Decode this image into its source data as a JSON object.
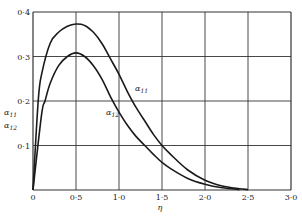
{
  "chart_data": {
    "type": "line",
    "title": "",
    "xlabel": "η",
    "ylabel": "α11, α12",
    "xlim": [
      0,
      3.0
    ],
    "ylim": [
      0,
      0.4
    ],
    "grid": true,
    "legend": "inline labels on curves",
    "x_ticks": [
      "0",
      "0·5",
      "1·0",
      "1·5",
      "2·0",
      "2·5",
      "3·0"
    ],
    "y_ticks": [
      "0·1",
      "0·2",
      "0·3",
      "0·4"
    ],
    "series": [
      {
        "name": "α11",
        "label_main": "α",
        "label_sub": "11",
        "x": [
          0,
          0.06,
          0.1,
          0.2,
          0.3,
          0.4,
          0.5,
          0.6,
          0.7,
          0.8,
          0.9,
          1.0,
          1.1,
          1.2,
          1.3,
          1.4,
          1.5,
          1.6,
          1.8,
          2.0,
          2.2,
          2.4,
          2.5
        ],
        "values": [
          0,
          0.2,
          0.26,
          0.33,
          0.355,
          0.368,
          0.373,
          0.37,
          0.355,
          0.33,
          0.295,
          0.26,
          0.22,
          0.185,
          0.155,
          0.125,
          0.1,
          0.08,
          0.045,
          0.022,
          0.009,
          0.003,
          0.001
        ]
      },
      {
        "name": "α12",
        "label_main": "α",
        "label_sub": "12",
        "x": [
          0,
          0.1,
          0.14,
          0.2,
          0.3,
          0.4,
          0.5,
          0.6,
          0.7,
          0.8,
          0.9,
          1.0,
          1.1,
          1.2,
          1.3,
          1.4,
          1.5,
          1.6,
          1.8,
          2.0,
          2.2,
          2.4
        ],
        "values": [
          0,
          0.17,
          0.2,
          0.24,
          0.28,
          0.3,
          0.308,
          0.3,
          0.28,
          0.25,
          0.21,
          0.175,
          0.145,
          0.12,
          0.1,
          0.08,
          0.062,
          0.048,
          0.026,
          0.013,
          0.005,
          0.001
        ]
      }
    ]
  },
  "axis": {
    "x_label": "η",
    "y_label_1_main": "α",
    "y_label_1_sub": "11",
    "y_label_2_main": "α",
    "y_label_2_sub": "12"
  },
  "colors": {
    "line": "#1a1a1a",
    "grid": "#333333",
    "background": "#ffffff"
  }
}
